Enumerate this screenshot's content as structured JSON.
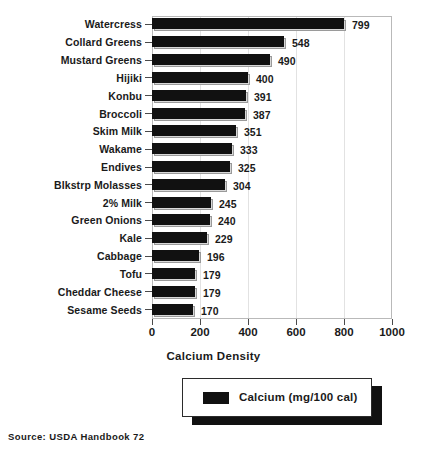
{
  "chart_data": {
    "type": "bar",
    "orientation": "horizontal",
    "title": "",
    "xlabel": "Calcium Density",
    "ylabel": "",
    "xlim": [
      0,
      1000
    ],
    "xticks": [
      0,
      200,
      400,
      600,
      800,
      1000
    ],
    "xtick_labels": [
      "0",
      "200",
      "400",
      "600",
      "800",
      "1000"
    ],
    "grid": true,
    "legend_position": "below-plot",
    "legend": [
      "Calcium (mg/100 cal)"
    ],
    "categories": [
      "Watercress",
      "Collard Greens",
      "Mustard Greens",
      "Hijiki",
      "Konbu",
      "Broccoli",
      "Skim Milk",
      "Wakame",
      "Endives",
      "Blkstrp Molasses",
      "2% Milk",
      "Green Onions",
      "Kale",
      "Cabbage",
      "Tofu",
      "Cheddar Cheese",
      "Sesame Seeds"
    ],
    "values": [
      799,
      548,
      490,
      400,
      391,
      387,
      351,
      333,
      325,
      304,
      245,
      240,
      229,
      196,
      179,
      179,
      170
    ],
    "series": [
      {
        "name": "Calcium (mg/100 cal)",
        "values": [
          799,
          548,
          490,
          400,
          391,
          387,
          351,
          333,
          325,
          304,
          245,
          240,
          229,
          196,
          179,
          179,
          170
        ]
      }
    ],
    "data_labels": [
      "799",
      "548",
      "490",
      "400",
      "391",
      "387",
      "351",
      "333",
      "325",
      "304",
      "245",
      "240",
      "229",
      "196",
      "179",
      "179",
      "170"
    ]
  },
  "legend": {
    "swatch_name": "calcium-swatch",
    "label": "Calcium (mg/100 cal)"
  },
  "axis": {
    "x_title": "Calcium Density"
  },
  "footer": {
    "source": "Source: USDA Handbook 72"
  },
  "colors": {
    "bar_fill": "#111111",
    "bar_shadow": "#d8d8d8",
    "frame": "#b9b9b9",
    "gridline": "#e2e2e2",
    "text": "#1a1a1a",
    "background": "#ffffff"
  }
}
